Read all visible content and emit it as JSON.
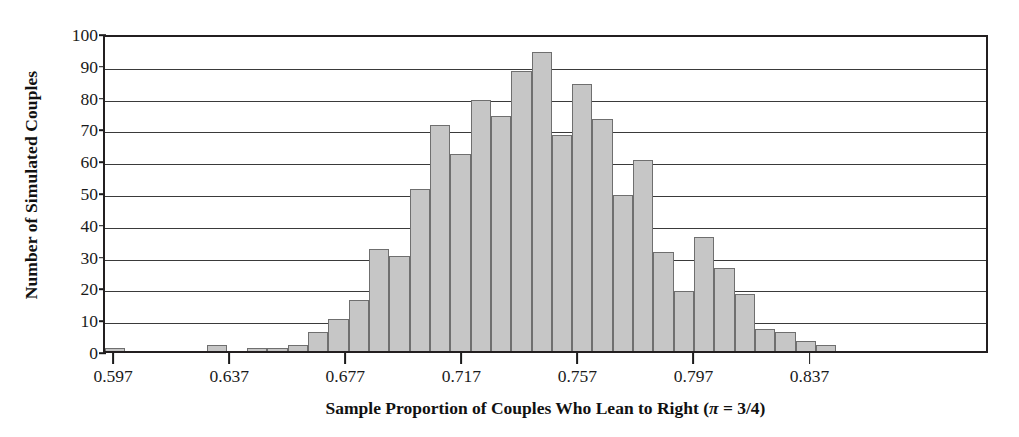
{
  "chart_data": {
    "type": "bar",
    "title": "",
    "subtitle": "",
    "xlabel": "Sample Proportion of Couples Who Lean to Right (π = 3/4)",
    "xlabel_parts": {
      "main": "Sample Proportion of Couples Who Lean to Right (",
      "symbol": "π",
      "tail": " = 3/4)"
    },
    "ylabel": "Number of Simulated Couples",
    "ylim": [
      0,
      100
    ],
    "ytick_labels": [
      "0",
      "10",
      "20",
      "30",
      "40",
      "50",
      "60",
      "70",
      "80",
      "90",
      "100"
    ],
    "ytick_values": [
      0,
      10,
      20,
      30,
      40,
      50,
      60,
      70,
      80,
      90,
      100
    ],
    "xtick_labels": [
      "0.597",
      "0.637",
      "0.677",
      "0.717",
      "0.757",
      "0.797",
      "0.837"
    ],
    "xtick_values": [
      0.597,
      0.637,
      0.677,
      0.717,
      0.757,
      0.797,
      0.837
    ],
    "xlim": [
      0.5935,
      0.8985
    ],
    "grid": "horizontal",
    "legend_position": "none",
    "bin_width": 0.007,
    "bar_color": "#c6c6c6",
    "bar_edge_color": "#6f6f6f",
    "axis_color": "#231f20",
    "bin_left_edges": [
      0.5935,
      0.6005,
      0.6075,
      0.6145,
      0.6215,
      0.6285,
      0.6355,
      0.6425,
      0.6495,
      0.6565,
      0.6635,
      0.6705,
      0.6775,
      0.6845,
      0.6915,
      0.6985,
      0.7055,
      0.7125,
      0.7195,
      0.7265,
      0.7335,
      0.7405,
      0.7475,
      0.7545,
      0.7615,
      0.7685,
      0.7755,
      0.7825,
      0.7895,
      0.7965,
      0.8035,
      0.8105,
      0.8175,
      0.8245,
      0.8315,
      0.8385,
      0.8455,
      0.8525,
      0.8595,
      0.8665,
      0.8735,
      0.8805,
      0.8875
    ],
    "values": [
      1,
      0,
      0,
      0,
      0,
      2,
      0,
      1,
      1,
      2,
      6,
      10,
      16,
      32,
      30,
      51,
      71,
      62,
      79,
      74,
      88,
      94,
      68,
      84,
      73,
      49,
      60,
      31,
      19,
      36,
      26,
      18,
      7,
      6,
      3,
      2,
      0,
      0,
      0,
      0,
      0,
      0,
      0
    ]
  }
}
